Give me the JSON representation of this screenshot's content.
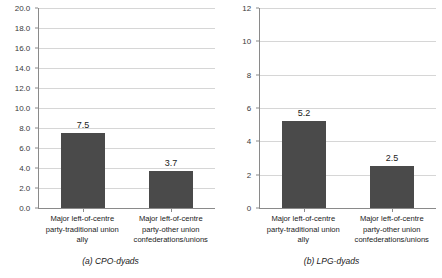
{
  "chart_data": [
    {
      "type": "bar",
      "panel_id": "a",
      "title": "(a) CPO-dyads",
      "categories": [
        "Major left-of-centre party-traditional union ally",
        "Major left-of-centre party-other union confederations/unions"
      ],
      "category_lines": [
        [
          "Major left-of-centre",
          "party-traditional union",
          "ally"
        ],
        [
          "Major left-of-centre",
          "party-other union",
          "confederations/unions"
        ]
      ],
      "values": [
        7.5,
        3.7
      ],
      "value_labels": [
        "7.5",
        "3.7"
      ],
      "xlabel": "",
      "ylabel": "",
      "ylim": [
        0.0,
        20.0
      ],
      "ytick_step": 2.0,
      "yticks": [
        0.0,
        2.0,
        4.0,
        6.0,
        8.0,
        10.0,
        12.0,
        14.0,
        16.0,
        18.0,
        20.0
      ],
      "ytick_labels": [
        "0.0",
        "2.0",
        "4.0",
        "6.0",
        "8.0",
        "10.0",
        "12.0",
        "14.0",
        "16.0",
        "18.0",
        "20.0"
      ],
      "grid": true,
      "legend": "none",
      "bar_color": "#4a4a4a"
    },
    {
      "type": "bar",
      "panel_id": "b",
      "title": "(b) LPG-dyads",
      "categories": [
        "Major left-of-centre party-traditional union ally",
        "Major left-of-centre party-other union confederations/unions"
      ],
      "category_lines": [
        [
          "Major left-of-centre",
          "party-traditional union",
          "ally"
        ],
        [
          "Major left-of-centre",
          "party-other union",
          "confederations/unions"
        ]
      ],
      "values": [
        5.2,
        2.5
      ],
      "value_labels": [
        "5.2",
        "2.5"
      ],
      "xlabel": "",
      "ylabel": "",
      "ylim": [
        0,
        12
      ],
      "ytick_step": 2,
      "yticks": [
        0,
        2,
        4,
        6,
        8,
        10,
        12
      ],
      "ytick_labels": [
        "0",
        "2",
        "4",
        "6",
        "8",
        "10",
        "12"
      ],
      "grid": true,
      "legend": "none",
      "bar_color": "#4a4a4a"
    }
  ],
  "colors": {
    "bar": "#4a4a4a",
    "grid": "#d6d6d6",
    "axis": "#8a8a8a",
    "text": "#1a1a1a",
    "background": "#ffffff"
  }
}
